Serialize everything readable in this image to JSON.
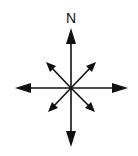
{
  "diagram": {
    "type": "compass-rose",
    "north_label": "N",
    "color": "#111111",
    "center": [
      71,
      88
    ],
    "arrows": [
      {
        "dir": "north",
        "tip": [
          71,
          28
        ],
        "size": "large"
      },
      {
        "dir": "south",
        "tip": [
          71,
          147
        ],
        "size": "large"
      },
      {
        "dir": "east",
        "tip": [
          128,
          88
        ],
        "size": "large"
      },
      {
        "dir": "west",
        "tip": [
          15,
          88
        ],
        "size": "large"
      },
      {
        "dir": "northeast",
        "tip": [
          96,
          62
        ],
        "size": "small"
      },
      {
        "dir": "northwest",
        "tip": [
          46,
          62
        ],
        "size": "small"
      },
      {
        "dir": "southeast",
        "tip": [
          95,
          112
        ],
        "size": "small"
      },
      {
        "dir": "southwest",
        "tip": [
          48,
          112
        ],
        "size": "small"
      }
    ]
  }
}
